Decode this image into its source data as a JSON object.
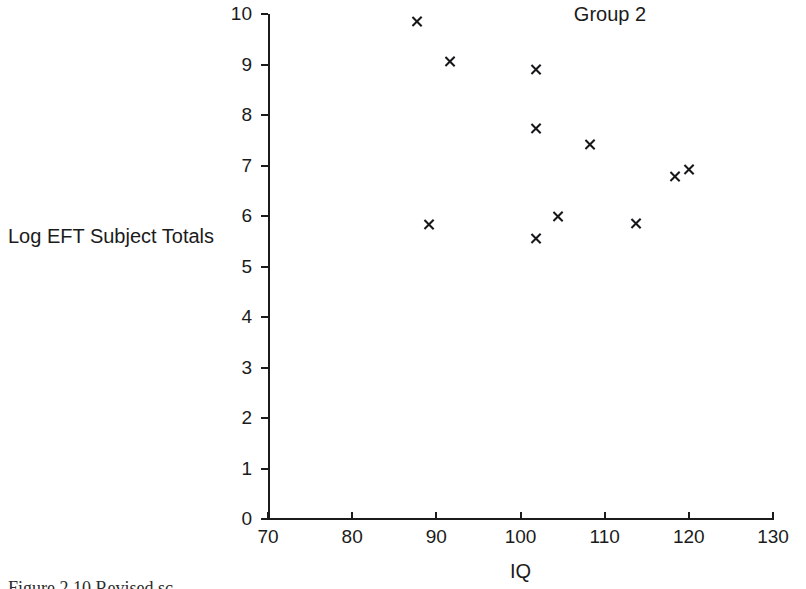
{
  "chart_data": {
    "type": "scatter",
    "title": "Group 2",
    "xlabel": "IQ",
    "ylabel": "Log EFT Subject Totals",
    "xlim": [
      70,
      130
    ],
    "ylim": [
      0,
      10
    ],
    "xticks": [
      70,
      80,
      90,
      100,
      110,
      120,
      130
    ],
    "yticks": [
      0,
      1,
      2,
      3,
      4,
      5,
      6,
      7,
      8,
      9,
      10
    ],
    "grid": false,
    "legend": null,
    "marker": "x",
    "marker_color": "#17171a",
    "points": [
      {
        "x": 87.7,
        "y": 9.86
      },
      {
        "x": 91.7,
        "y": 9.05
      },
      {
        "x": 101.9,
        "y": 8.91
      },
      {
        "x": 101.9,
        "y": 7.74
      },
      {
        "x": 108.3,
        "y": 7.42
      },
      {
        "x": 120.1,
        "y": 6.93
      },
      {
        "x": 118.4,
        "y": 6.79
      },
      {
        "x": 104.5,
        "y": 6.0
      },
      {
        "x": 113.7,
        "y": 5.86
      },
      {
        "x": 89.1,
        "y": 5.84
      },
      {
        "x": 101.9,
        "y": 5.56
      }
    ]
  },
  "axes": {
    "x_tick_labels": [
      "70",
      "80",
      "90",
      "100",
      "110",
      "120",
      "130"
    ],
    "y_tick_labels": [
      "0",
      "1",
      "2",
      "3",
      "4",
      "5",
      "6",
      "7",
      "8",
      "9",
      "10"
    ]
  },
  "caption": {
    "text": "Figure 2.10  Revised sc"
  }
}
